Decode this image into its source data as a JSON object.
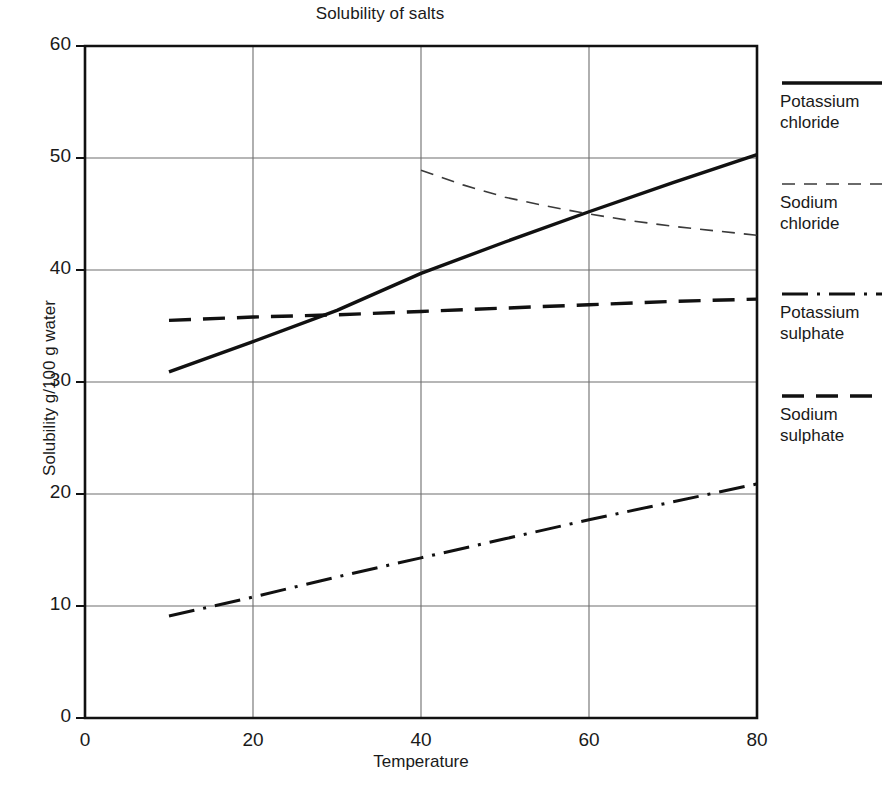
{
  "chart_data": {
    "type": "line",
    "title": "Solubility of salts",
    "xlabel": "Temperature",
    "ylabel": "Solubility g/100 g water",
    "xlim": [
      0,
      80
    ],
    "ylim": [
      0,
      60
    ],
    "xticks": [
      "0",
      "20",
      "40",
      "60",
      "80"
    ],
    "xtick_values": [
      0,
      20,
      40,
      60,
      80
    ],
    "yticks": [
      "0",
      "10",
      "20",
      "30",
      "40",
      "50",
      "60"
    ],
    "ytick_values": [
      0,
      10,
      20,
      30,
      40,
      50,
      60
    ],
    "grid": true,
    "legend_position": "right",
    "series": [
      {
        "name": "Potassium chloride",
        "label_line1": "Potassium",
        "label_line2": "chloride",
        "style": "solid",
        "color": "#111111",
        "width": 3.4,
        "x": [
          10,
          20,
          30,
          40,
          50,
          60,
          70,
          80
        ],
        "y": [
          30.9,
          33.6,
          36.4,
          39.7,
          42.5,
          45.2,
          47.8,
          50.3
        ]
      },
      {
        "name": "Sodium chloride",
        "label_line1": "Sodium",
        "label_line2": "chloride",
        "style": "dashed-fine",
        "color": "#3a3a3a",
        "width": 1.6,
        "x": [
          40,
          45,
          50,
          55,
          60,
          65,
          70,
          75,
          80
        ],
        "y": [
          48.9,
          47.6,
          46.5,
          45.7,
          45.0,
          44.4,
          43.9,
          43.5,
          43.1
        ]
      },
      {
        "name": "Potassium sulphate",
        "label_line1": "Potassium",
        "label_line2": "sulphate",
        "style": "dash-dot",
        "color": "#111111",
        "width": 3.0,
        "x": [
          10,
          20,
          30,
          40,
          50,
          60,
          70,
          80
        ],
        "y": [
          9.1,
          10.8,
          12.6,
          14.3,
          16.0,
          17.7,
          19.3,
          20.9
        ]
      },
      {
        "name": "Sodium sulphate",
        "label_line1": "Sodium",
        "label_line2": "sulphate",
        "style": "dashed-heavy",
        "color": "#111111",
        "width": 3.4,
        "x": [
          10,
          20,
          30,
          40,
          50,
          60,
          70,
          80
        ],
        "y": [
          35.5,
          35.8,
          36.0,
          36.3,
          36.6,
          36.9,
          37.2,
          37.4
        ]
      }
    ]
  },
  "legend": {
    "entries": [
      {
        "line1": "Potassium",
        "line2": "chloride"
      },
      {
        "line1": "Sodium",
        "line2": "chloride"
      },
      {
        "line1": "Potassium",
        "line2": "sulphate"
      },
      {
        "line1": "Sodium",
        "line2": "sulphate"
      }
    ]
  },
  "axes": {
    "x_title": "Temperature",
    "y_title": "Solubility g/100 g water"
  }
}
